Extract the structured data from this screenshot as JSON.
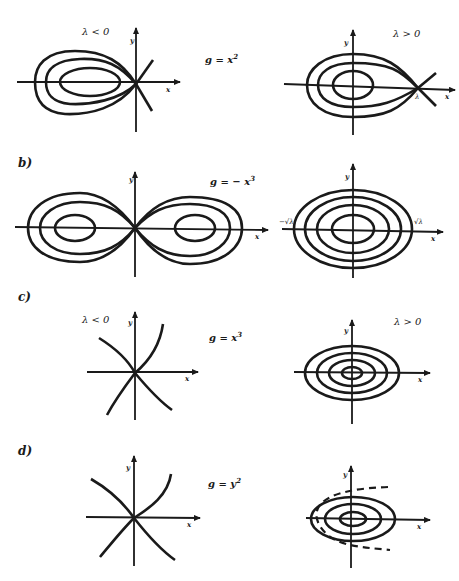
{
  "figure": {
    "panels": [
      {
        "id": "a",
        "label": "",
        "equation": "g = x",
        "equation_exp": "2",
        "left": {
          "condition": "λ < 0",
          "xlabel": "x",
          "ylabel": "y",
          "type": "homoclinic loop with centers, saddle at origin"
        },
        "right": {
          "condition": "λ > 0",
          "xlabel": "x",
          "ylabel": "y",
          "point_label": "λ",
          "type": "homoclinic loop with centers, saddle at λ"
        }
      },
      {
        "id": "b",
        "label": "b)",
        "equation": "g = − x",
        "equation_exp": "3",
        "left": {
          "condition": "",
          "xlabel": "x",
          "ylabel": "y",
          "type": "figure-eight separatrix, two centers"
        },
        "right": {
          "condition": "",
          "xlabel": "x",
          "ylabel": "y",
          "neg_tick": "−√λ",
          "pos_tick": "√λ",
          "type": "nested closed orbits"
        }
      },
      {
        "id": "c",
        "label": "c)",
        "equation": "g = x",
        "equation_exp": "3",
        "left": {
          "condition": "λ < 0",
          "xlabel": "x",
          "ylabel": "y",
          "type": "saddle"
        },
        "right": {
          "condition": "λ > 0",
          "xlabel": "x",
          "ylabel": "y",
          "type": "nested closed orbits (center)"
        }
      },
      {
        "id": "d",
        "label": "d)",
        "equation": "g = y",
        "equation_exp": "2",
        "left": {
          "condition": "",
          "xlabel": "x",
          "ylabel": "y",
          "type": "saddle"
        },
        "right": {
          "condition": "",
          "xlabel": "x",
          "ylabel": "y",
          "type": "center with dashed parabolic boundary"
        }
      }
    ]
  }
}
